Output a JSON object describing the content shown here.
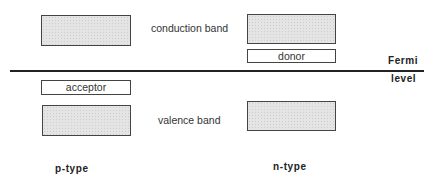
{
  "diagram": {
    "center_labels": {
      "conduction": "conduction band",
      "valence": "valence band"
    },
    "fermi_level": {
      "line1": "Fermi",
      "line2": "level"
    },
    "p_type": {
      "label": "p-type",
      "impurity_level": "acceptor"
    },
    "n_type": {
      "label": "n-type",
      "impurity_level": "donor"
    },
    "colors": {
      "band_fill": "#e4e4e4",
      "outline": "#444444",
      "fermi_line": "#222222"
    }
  }
}
